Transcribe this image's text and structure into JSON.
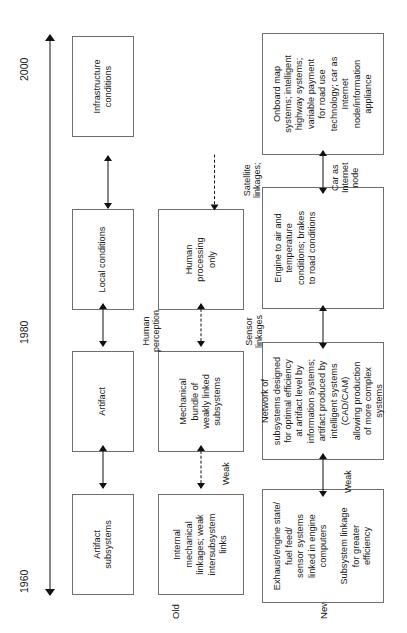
{
  "figure": {
    "timeline": {
      "ticks": [
        {
          "label": "1960"
        },
        {
          "label": "1980"
        },
        {
          "label": "2000"
        }
      ]
    },
    "row_labels": {
      "old": "Old",
      "new": "New"
    },
    "rows": {
      "levels": [
        {
          "name": "artifact-subsystems",
          "text": "Artifact\nsubsystems"
        },
        {
          "name": "artifact",
          "text": "Artifact"
        },
        {
          "name": "local-conditions",
          "text": "Local conditions"
        },
        {
          "name": "infrastructure-conditions",
          "text": "Infrastructure\nconditions"
        }
      ],
      "old": [
        {
          "name": "old-internal-mechanical",
          "segments": [
            "Internal\nmechanical\nlinkages; weak\nintersubsystem\nlinks"
          ]
        },
        {
          "name": "old-mechanical-bundle",
          "segments": [
            "Mechanical\nbundle of\nweakly linked\nsubsystems"
          ]
        },
        {
          "name": "old-human-processing",
          "segments": [
            "Human\nprocessing\nonly"
          ]
        }
      ],
      "new": [
        {
          "name": "new-exhaust-engine-state",
          "segments": [
            "Exhaust/engine state/\nfuel feed/\nsensor systems\nlinked in engine\ncomputers",
            "Subsystem linkage\nfor greater\nefficiency"
          ]
        },
        {
          "name": "new-network-of-subsystems",
          "segments": [
            "Network of\nsubsystems designed\nfor optimal efficiency\nat artifact level by\ninformation systems;\nartifact produced by\nintelligent systems\n(CAD/CAM)\nallowing production\nof more complex\nsystems"
          ]
        },
        {
          "name": "new-engine-to-air",
          "segments": [
            "Engine to air and\ntemperature\nconditions; brakes\nto road conditions"
          ]
        },
        {
          "name": "new-onboard-map",
          "segments": [
            "Onboard map\nsystems; intelligent\nhighway systems;\nvariable payment\nfor road use\ntechnology; car as\nInternet\nnode/information\nappliance"
          ]
        }
      ]
    },
    "connectors": {
      "levels": [
        {
          "name": "connector-subsystems-artifact",
          "label": ""
        },
        {
          "name": "connector-artifact-local",
          "label": ""
        },
        {
          "name": "connector-local-infrastructure",
          "label": ""
        }
      ],
      "old": [
        {
          "name": "connector-old-weak",
          "label": "Weak"
        },
        {
          "name": "connector-old-human-perception",
          "label": "Human\nperception"
        },
        {
          "name": "connector-old-to-infrastructure",
          "label": ""
        }
      ],
      "new": [
        {
          "name": "connector-new-weak",
          "label": "Weak"
        },
        {
          "name": "connector-new-sensor-linkages",
          "label": "Sensor\nlinkages"
        },
        {
          "name": "connector-new-satellite-linkages",
          "label": "Satellite\nlinkages;"
        },
        {
          "name": "connector-new-car-as-internet-node",
          "label": "Car as\nInternet\nnode"
        }
      ]
    }
  }
}
